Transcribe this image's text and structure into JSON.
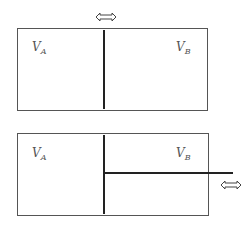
{
  "diagrams": [
    {
      "id": "top",
      "labels": {
        "left": {
          "main": "V",
          "sub": "A"
        },
        "right": {
          "main": "V",
          "sub": "B"
        }
      },
      "arrow_icon": "double-arrow-horizontal"
    },
    {
      "id": "bottom",
      "labels": {
        "left": {
          "main": "V",
          "sub": "A"
        },
        "right": {
          "main": "V",
          "sub": "B"
        }
      },
      "arrow_icon": "double-arrow-horizontal"
    }
  ]
}
